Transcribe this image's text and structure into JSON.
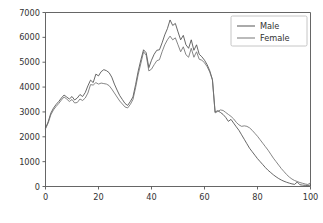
{
  "chart_data": {
    "type": "line",
    "title": "",
    "xlabel": "",
    "ylabel": "",
    "xlim": [
      0,
      100
    ],
    "ylim": [
      0,
      7000
    ],
    "grid": false,
    "legend_position": "upper right",
    "xticks": [
      0,
      20,
      40,
      60,
      80,
      100
    ],
    "yticks": [
      0,
      1000,
      2000,
      3000,
      4000,
      5000,
      6000,
      7000
    ],
    "xtick_labels": [
      "0",
      "20",
      "40",
      "60",
      "80",
      "100"
    ],
    "ytick_labels": [
      "0",
      "1000",
      "2000",
      "3000",
      "4000",
      "5000",
      "6000",
      "7000"
    ],
    "x": [
      0,
      1,
      2,
      3,
      4,
      5,
      6,
      7,
      8,
      9,
      10,
      11,
      12,
      13,
      14,
      15,
      16,
      17,
      18,
      19,
      20,
      21,
      22,
      23,
      24,
      25,
      26,
      27,
      28,
      29,
      30,
      31,
      32,
      33,
      34,
      35,
      36,
      37,
      38,
      39,
      40,
      41,
      42,
      43,
      44,
      45,
      46,
      47,
      48,
      49,
      50,
      51,
      52,
      53,
      54,
      55,
      56,
      57,
      58,
      59,
      60,
      61,
      62,
      63,
      64,
      65,
      66,
      67,
      68,
      69,
      70,
      71,
      72,
      73,
      74,
      75,
      76,
      77,
      78,
      79,
      80,
      81,
      82,
      83,
      84,
      85,
      86,
      87,
      88,
      89,
      90,
      91,
      92,
      93,
      94,
      95,
      96,
      97,
      98,
      99,
      100
    ],
    "series": [
      {
        "name": "Male",
        "color": "#4d4d4d",
        "values": [
          2350,
          2600,
          2950,
          3150,
          3300,
          3420,
          3560,
          3680,
          3600,
          3520,
          3620,
          3480,
          3560,
          3700,
          3620,
          3780,
          4050,
          4280,
          4180,
          4520,
          4450,
          4620,
          4700,
          4660,
          4580,
          4400,
          4120,
          3880,
          3660,
          3500,
          3340,
          3260,
          3420,
          3600,
          4100,
          4650,
          5100,
          5500,
          5380,
          4780,
          5080,
          5320,
          5480,
          5500,
          5780,
          6100,
          6350,
          6700,
          6480,
          6560,
          6220,
          5900,
          6080,
          5700,
          5560,
          5900,
          5480,
          5700,
          5320,
          5220,
          5080,
          4900,
          4650,
          4300,
          3000,
          3050,
          2980,
          2900,
          2780,
          2620,
          2700,
          2550,
          2400,
          2260,
          2080,
          1900,
          1720,
          1540,
          1400,
          1260,
          1120,
          1000,
          880,
          760,
          650,
          560,
          470,
          390,
          320,
          260,
          210,
          170,
          135,
          105,
          85,
          180,
          70,
          55,
          45,
          40,
          60
        ]
      },
      {
        "name": "Female",
        "color": "#707070",
        "values": [
          2320,
          2550,
          2880,
          3080,
          3220,
          3340,
          3480,
          3600,
          3520,
          3420,
          3500,
          3360,
          3380,
          3520,
          3460,
          3560,
          3760,
          4100,
          4080,
          4180,
          4120,
          4160,
          4140,
          4120,
          4060,
          3920,
          3760,
          3600,
          3440,
          3320,
          3200,
          3160,
          3300,
          3500,
          3980,
          4520,
          4960,
          5420,
          5280,
          4650,
          4720,
          4900,
          5060,
          5100,
          5420,
          5700,
          5900,
          6050,
          5900,
          5980,
          5700,
          5420,
          5620,
          5300,
          5200,
          5560,
          5200,
          5420,
          5120,
          5080,
          4980,
          4820,
          4600,
          4280,
          2960,
          3020,
          3080,
          3060,
          2980,
          2900,
          2820,
          2720,
          2580,
          2480,
          2420,
          2440,
          2420,
          2360,
          2260,
          2140,
          2020,
          1880,
          1740,
          1600,
          1460,
          1300,
          1140,
          1000,
          860,
          720,
          600,
          480,
          380,
          300,
          240,
          200,
          160,
          130,
          100,
          80,
          150
        ]
      }
    ]
  },
  "legend": {
    "entries": [
      {
        "label": "Male"
      },
      {
        "label": "Female"
      }
    ]
  },
  "icons": {
    "legend_line_male": "line-sample-icon",
    "legend_line_female": "line-sample-icon"
  }
}
